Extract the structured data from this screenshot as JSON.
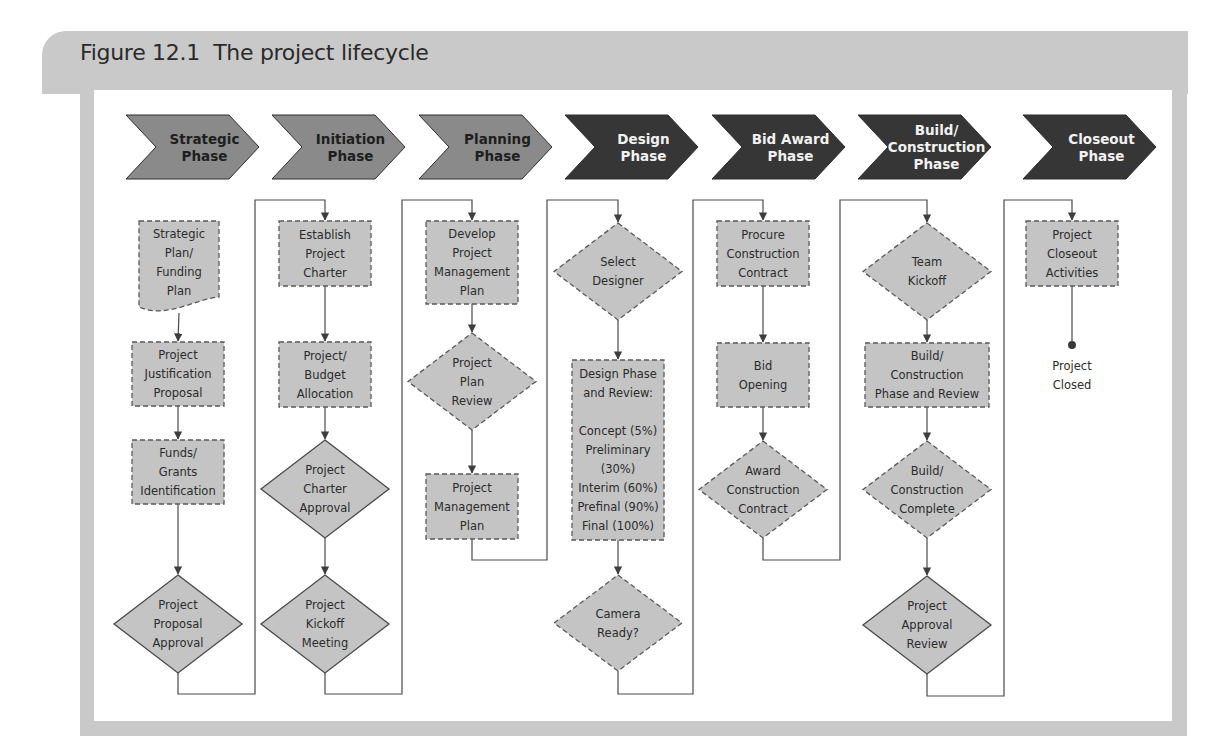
{
  "figure": {
    "title": "Figure 12.1  The project lifecycle"
  },
  "colors": {
    "phase_light": "#8a8a8a",
    "phase_dark": "#363636",
    "node_fill": "#c4c4c4",
    "line": "#4a4a4a",
    "frame": "#c9c9c9"
  },
  "phases": [
    {
      "id": "strategic",
      "lines": [
        "Strategic",
        "Phase"
      ],
      "tone": "light"
    },
    {
      "id": "initiation",
      "lines": [
        "Initiation",
        "Phase"
      ],
      "tone": "light"
    },
    {
      "id": "planning",
      "lines": [
        "Planning",
        "Phase"
      ],
      "tone": "light"
    },
    {
      "id": "design",
      "lines": [
        "Design",
        "Phase"
      ],
      "tone": "dark"
    },
    {
      "id": "bid-award",
      "lines": [
        "Bid Award",
        "Phase"
      ],
      "tone": "dark"
    },
    {
      "id": "build-construction",
      "lines": [
        "Build/",
        "Construction",
        "Phase"
      ],
      "tone": "dark"
    },
    {
      "id": "closeout",
      "lines": [
        "Closeout",
        "Phase"
      ],
      "tone": "dark"
    }
  ],
  "nodes": [
    {
      "id": "strategic-plan-funding-plan",
      "phase": "strategic",
      "shape": "document",
      "border": "dashed",
      "lines": [
        "Strategic",
        "Plan/",
        "Funding",
        "Plan"
      ]
    },
    {
      "id": "project-justification-proposal",
      "phase": "strategic",
      "shape": "process",
      "border": "dashed",
      "lines": [
        "Project",
        "Justification",
        "Proposal"
      ]
    },
    {
      "id": "funds-grants-identification",
      "phase": "strategic",
      "shape": "process",
      "border": "dashed",
      "lines": [
        "Funds/",
        "Grants",
        "Identification"
      ]
    },
    {
      "id": "project-proposal-approval",
      "phase": "strategic",
      "shape": "decision",
      "border": "solid",
      "lines": [
        "Project",
        "Proposal",
        "Approval"
      ]
    },
    {
      "id": "establish-project-charter",
      "phase": "initiation",
      "shape": "process",
      "border": "dashed",
      "lines": [
        "Establish",
        "Project",
        "Charter"
      ]
    },
    {
      "id": "project-budget-allocation",
      "phase": "initiation",
      "shape": "process",
      "border": "dashed",
      "lines": [
        "Project/",
        "Budget",
        "Allocation"
      ]
    },
    {
      "id": "project-charter-approval",
      "phase": "initiation",
      "shape": "decision",
      "border": "solid",
      "lines": [
        "Project",
        "Charter",
        "Approval"
      ]
    },
    {
      "id": "project-kickoff-meeting",
      "phase": "initiation",
      "shape": "decision",
      "border": "solid",
      "lines": [
        "Project",
        "Kickoff",
        "Meeting"
      ]
    },
    {
      "id": "develop-project-management-plan",
      "phase": "planning",
      "shape": "process",
      "border": "dashed",
      "lines": [
        "Develop",
        "Project",
        "Management",
        "Plan"
      ]
    },
    {
      "id": "project-plan-review",
      "phase": "planning",
      "shape": "decision",
      "border": "dashed",
      "lines": [
        "Project",
        "Plan",
        "Review"
      ]
    },
    {
      "id": "project-management-plan",
      "phase": "planning",
      "shape": "process",
      "border": "dashed",
      "lines": [
        "Project",
        "Management",
        "Plan"
      ]
    },
    {
      "id": "select-designer",
      "phase": "design",
      "shape": "decision",
      "border": "dashed",
      "lines": [
        "Select",
        "Designer"
      ]
    },
    {
      "id": "design-phase-and-review",
      "phase": "design",
      "shape": "process",
      "border": "dashed",
      "lines": [
        "Design Phase",
        "and Review:",
        "",
        "Concept (5%)",
        "Preliminary",
        "(30%)",
        "Interim (60%)",
        "Prefinal (90%)",
        "Final (100%)"
      ]
    },
    {
      "id": "camera-ready",
      "phase": "design",
      "shape": "decision",
      "border": "dashed",
      "lines": [
        "Camera",
        "Ready?"
      ]
    },
    {
      "id": "procure-construction-contract",
      "phase": "bid-award",
      "shape": "process",
      "border": "dashed",
      "lines": [
        "Procure",
        "Construction",
        "Contract"
      ]
    },
    {
      "id": "bid-opening",
      "phase": "bid-award",
      "shape": "process",
      "border": "dashed",
      "lines": [
        "Bid",
        "Opening"
      ]
    },
    {
      "id": "award-construction-contract",
      "phase": "bid-award",
      "shape": "decision",
      "border": "dashed",
      "lines": [
        "Award",
        "Construction",
        "Contract"
      ]
    },
    {
      "id": "team-kickoff",
      "phase": "build-construction",
      "shape": "decision",
      "border": "dashed",
      "lines": [
        "Team",
        "Kickoff"
      ]
    },
    {
      "id": "build-construction-phase-and-review",
      "phase": "build-construction",
      "shape": "process",
      "border": "dashed",
      "lines": [
        "Build/",
        "Construction",
        "Phase and Review"
      ]
    },
    {
      "id": "build-construction-complete",
      "phase": "build-construction",
      "shape": "decision",
      "border": "dashed",
      "lines": [
        "Build/",
        "Construction",
        "Complete"
      ]
    },
    {
      "id": "project-approval-review",
      "phase": "build-construction",
      "shape": "decision",
      "border": "solid",
      "lines": [
        "Project",
        "Approval",
        "Review"
      ]
    },
    {
      "id": "project-closeout-activities",
      "phase": "closeout",
      "shape": "process",
      "border": "dashed",
      "lines": [
        "Project",
        "Closeout",
        "Activities"
      ]
    },
    {
      "id": "project-closed",
      "phase": "closeout",
      "shape": "terminal",
      "border": "none",
      "lines": [
        "Project",
        "Closed"
      ]
    }
  ],
  "edges": [
    [
      "strategic-plan-funding-plan",
      "project-justification-proposal"
    ],
    [
      "project-justification-proposal",
      "funds-grants-identification"
    ],
    [
      "funds-grants-identification",
      "project-proposal-approval"
    ],
    [
      "project-proposal-approval",
      "establish-project-charter"
    ],
    [
      "establish-project-charter",
      "project-budget-allocation"
    ],
    [
      "project-budget-allocation",
      "project-charter-approval"
    ],
    [
      "project-charter-approval",
      "project-kickoff-meeting"
    ],
    [
      "project-kickoff-meeting",
      "develop-project-management-plan"
    ],
    [
      "develop-project-management-plan",
      "project-plan-review"
    ],
    [
      "project-plan-review",
      "project-management-plan"
    ],
    [
      "project-management-plan",
      "select-designer"
    ],
    [
      "select-designer",
      "design-phase-and-review"
    ],
    [
      "design-phase-and-review",
      "camera-ready"
    ],
    [
      "camera-ready",
      "procure-construction-contract"
    ],
    [
      "procure-construction-contract",
      "bid-opening"
    ],
    [
      "bid-opening",
      "award-construction-contract"
    ],
    [
      "award-construction-contract",
      "team-kickoff"
    ],
    [
      "team-kickoff",
      "build-construction-phase-and-review"
    ],
    [
      "build-construction-phase-and-review",
      "build-construction-complete"
    ],
    [
      "build-construction-complete",
      "project-approval-review"
    ],
    [
      "project-approval-review",
      "project-closeout-activities"
    ],
    [
      "project-closeout-activities",
      "project-closed"
    ]
  ]
}
